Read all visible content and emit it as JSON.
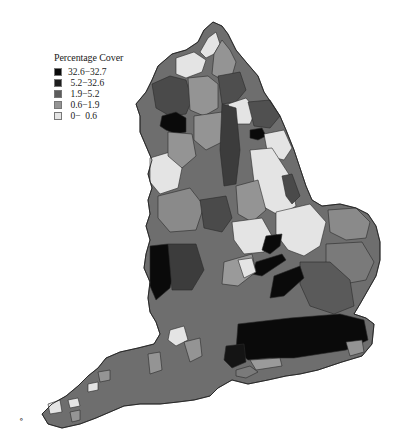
{
  "figure": {
    "type": "choropleth-map"
  },
  "legend": {
    "title": "Percentage Cover",
    "classes": [
      {
        "label": "32.6−32.7",
        "color": "#0a0a0a"
      },
      {
        "label": " 5.2−32.6",
        "color": "#1e1e1e"
      },
      {
        "label": " 1.9−5.2",
        "color": "#5c5c5c"
      },
      {
        "label": " 0.6−1.9",
        "color": "#949494"
      },
      {
        "label": " 0−  0.6",
        "color": "#e4e4e4"
      }
    ]
  },
  "colors": {
    "c1": "#0a0a0a",
    "c2": "#1e1e1e",
    "c3": "#5c5c5c",
    "c4": "#949494",
    "c5": "#e4e4e4",
    "outline": "#2a2a2a",
    "background": "#ffffff"
  },
  "stray_mark": "∘"
}
